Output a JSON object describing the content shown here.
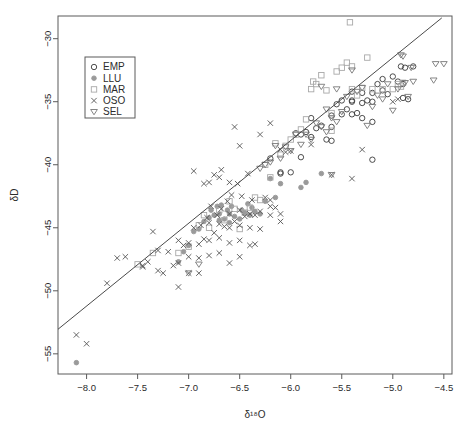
{
  "chart_data": {
    "type": "scatter",
    "title": "",
    "subtitle": "",
    "xlabel": "δ¹⁸O",
    "ylabel": "δD",
    "xlim": [
      -8.28,
      -4.42
    ],
    "ylim": [
      -56.6,
      -28.2
    ],
    "xticks": [
      -8.0,
      -7.5,
      -7.0,
      -6.5,
      -6.0,
      -5.5,
      -5.0,
      -4.5
    ],
    "xticklabels": [
      "-8.0",
      "-7.5",
      "-7.0",
      "-6.5",
      "-6.0",
      "-5.5",
      "-5.0",
      "-4.5"
    ],
    "yticks": [
      -30,
      -35,
      -40,
      -45,
      -50,
      -55
    ],
    "yticklabels": [
      "-30",
      "-35",
      "-40",
      "-45",
      "-50",
      "-55"
    ],
    "grid": false,
    "box": true,
    "legend": {
      "position": "top-left",
      "entries": [
        {
          "name": "EMP",
          "marker": "circle-open",
          "color": "#3a3a3a"
        },
        {
          "name": "LLU",
          "marker": "circle-filled",
          "color": "#9a9a9a"
        },
        {
          "name": "MAR",
          "marker": "square-open",
          "color": "#a8a8a8"
        },
        {
          "name": "OSO",
          "marker": "cross-x",
          "color": "#555555"
        },
        {
          "name": "SEL",
          "marker": "triangle-down-open",
          "color": "#777777"
        }
      ]
    },
    "fit_line": {
      "label": "regression line",
      "p1": [
        -8.28,
        -53.05
      ],
      "p2": [
        -4.52,
        -28.35
      ],
      "slope": 6.57,
      "intercept": 1.34,
      "color": "#4a4a4a",
      "width": 1.0
    },
    "series": [
      {
        "name": "EMP",
        "marker": "circle-open",
        "color": "#3a3a3a",
        "points": [
          [
            -6.2,
            -39.5
          ],
          [
            -6.1,
            -40.6
          ],
          [
            -6.1,
            -40.7
          ],
          [
            -6.0,
            -40.6
          ],
          [
            -5.95,
            -37.5
          ],
          [
            -5.9,
            -37.6
          ],
          [
            -5.9,
            -39.4
          ],
          [
            -5.85,
            -37.4
          ],
          [
            -5.8,
            -37.8
          ],
          [
            -5.8,
            -36.3
          ],
          [
            -5.75,
            -37.1
          ],
          [
            -5.7,
            -36.9
          ],
          [
            -5.65,
            -38.0
          ],
          [
            -5.6,
            -38.1
          ],
          [
            -5.6,
            -37.0
          ],
          [
            -5.6,
            -36.1
          ],
          [
            -5.55,
            -35.2
          ],
          [
            -5.5,
            -36.0
          ],
          [
            -5.5,
            -34.9
          ],
          [
            -5.45,
            -35.6
          ],
          [
            -5.4,
            -36.0
          ],
          [
            -5.4,
            -35.0
          ],
          [
            -5.4,
            -34.9
          ],
          [
            -5.4,
            -34.2
          ],
          [
            -5.35,
            -35.9
          ],
          [
            -5.3,
            -36.3
          ],
          [
            -5.3,
            -35.1
          ],
          [
            -5.3,
            -34.3
          ],
          [
            -5.25,
            -34.9
          ],
          [
            -5.2,
            -39.6
          ],
          [
            -5.2,
            -36.6
          ],
          [
            -5.2,
            -35.0
          ],
          [
            -5.2,
            -34.3
          ],
          [
            -5.15,
            -33.6
          ],
          [
            -5.1,
            -34.1
          ],
          [
            -5.1,
            -33.2
          ],
          [
            -5.05,
            -34.4
          ],
          [
            -5.0,
            -33.0
          ],
          [
            -4.95,
            -33.4
          ],
          [
            -4.92,
            -32.2
          ],
          [
            -4.9,
            -34.7
          ],
          [
            -4.9,
            -33.6
          ],
          [
            -4.88,
            -32.3
          ],
          [
            -4.85,
            -34.8
          ],
          [
            -4.8,
            -32.2
          ]
        ]
      },
      {
        "name": "LLU",
        "marker": "circle-filled",
        "color": "#9a9a9a",
        "points": [
          [
            -8.1,
            -55.7
          ],
          [
            -7.1,
            -47.7
          ],
          [
            -7.05,
            -46.9
          ],
          [
            -7.0,
            -46.4
          ],
          [
            -6.95,
            -45.3
          ],
          [
            -6.9,
            -45.1
          ],
          [
            -6.85,
            -44.5
          ],
          [
            -6.8,
            -44.2
          ],
          [
            -6.78,
            -43.6
          ],
          [
            -6.75,
            -44.0
          ],
          [
            -6.72,
            -43.3
          ],
          [
            -6.7,
            -44.4
          ],
          [
            -6.7,
            -43.9
          ],
          [
            -6.68,
            -43.2
          ],
          [
            -6.65,
            -44.3
          ],
          [
            -6.62,
            -43.6
          ],
          [
            -6.6,
            -44.6
          ],
          [
            -6.6,
            -43.9
          ],
          [
            -6.58,
            -43.3
          ],
          [
            -6.55,
            -44.1
          ],
          [
            -6.5,
            -44.3
          ],
          [
            -6.48,
            -43.6
          ],
          [
            -6.45,
            -43.8
          ],
          [
            -6.42,
            -43.1
          ],
          [
            -6.4,
            -44.0
          ],
          [
            -6.38,
            -43.4
          ],
          [
            -6.35,
            -43.7
          ],
          [
            -6.3,
            -43.9
          ],
          [
            -6.25,
            -42.9
          ],
          [
            -6.2,
            -41.1
          ],
          [
            -6.15,
            -42.6
          ],
          [
            -6.1,
            -41.5
          ],
          [
            -5.9,
            -41.8
          ],
          [
            -5.85,
            -41.4
          ],
          [
            -5.7,
            -40.7
          ]
        ]
      },
      {
        "name": "MAR",
        "marker": "square-open",
        "color": "#a8a8a8",
        "points": [
          [
            -7.5,
            -47.9
          ],
          [
            -7.35,
            -47.0
          ],
          [
            -7.1,
            -47.0
          ],
          [
            -7.0,
            -46.5
          ],
          [
            -6.9,
            -44.8
          ],
          [
            -6.85,
            -44.0
          ],
          [
            -6.8,
            -45.0
          ],
          [
            -6.7,
            -43.6
          ],
          [
            -6.65,
            -44.4
          ],
          [
            -6.6,
            -42.9
          ],
          [
            -6.55,
            -43.5
          ],
          [
            -6.5,
            -45.1
          ],
          [
            -6.45,
            -43.8
          ],
          [
            -6.4,
            -43.4
          ],
          [
            -6.35,
            -42.6
          ],
          [
            -6.3,
            -42.8
          ],
          [
            -6.25,
            -40.0
          ],
          [
            -6.2,
            -41.0
          ],
          [
            -6.15,
            -38.3
          ],
          [
            -6.1,
            -39.2
          ],
          [
            -6.05,
            -38.5
          ],
          [
            -6.0,
            -38.0
          ],
          [
            -5.95,
            -37.6
          ],
          [
            -5.9,
            -37.2
          ],
          [
            -5.85,
            -36.4
          ],
          [
            -5.8,
            -34.0
          ],
          [
            -5.78,
            -33.4
          ],
          [
            -5.75,
            -33.6
          ],
          [
            -5.7,
            -32.9
          ],
          [
            -5.65,
            -34.1
          ],
          [
            -5.6,
            -37.3
          ],
          [
            -5.6,
            -35.9
          ],
          [
            -5.55,
            -32.6
          ],
          [
            -5.5,
            -32.3
          ],
          [
            -5.45,
            -31.9
          ],
          [
            -5.42,
            -28.7
          ],
          [
            -5.4,
            -34.0
          ],
          [
            -5.4,
            -32.2
          ],
          [
            -5.35,
            -34.5
          ],
          [
            -5.3,
            -33.9
          ],
          [
            -5.25,
            -31.5
          ],
          [
            -5.2,
            -34.0
          ],
          [
            -5.1,
            -34.0
          ],
          [
            -5.0,
            -34.0
          ],
          [
            -4.95,
            -33.6
          ],
          [
            -4.92,
            -33.8
          ],
          [
            -4.9,
            -33.5
          ]
        ]
      },
      {
        "name": "OSO",
        "marker": "cross-x",
        "color": "#555555",
        "points": [
          [
            -8.1,
            -53.5
          ],
          [
            -8.0,
            -54.2
          ],
          [
            -7.8,
            -49.4
          ],
          [
            -7.7,
            -47.4
          ],
          [
            -7.62,
            -47.3
          ],
          [
            -7.45,
            -48.0
          ],
          [
            -7.4,
            -47.7
          ],
          [
            -7.35,
            -45.3
          ],
          [
            -7.3,
            -48.4
          ],
          [
            -7.3,
            -46.8
          ],
          [
            -7.25,
            -48.6
          ],
          [
            -7.2,
            -46.9
          ],
          [
            -7.15,
            -48.0
          ],
          [
            -7.1,
            -49.7
          ],
          [
            -7.1,
            -47.8
          ],
          [
            -7.1,
            -46.0
          ],
          [
            -7.05,
            -46.4
          ],
          [
            -7.0,
            -48.6
          ],
          [
            -7.0,
            -47.3
          ],
          [
            -7.0,
            -46.2
          ],
          [
            -6.95,
            -45.0
          ],
          [
            -6.9,
            -48.6
          ],
          [
            -6.9,
            -47.4
          ],
          [
            -6.9,
            -46.3
          ],
          [
            -6.88,
            -44.8
          ],
          [
            -6.85,
            -45.9
          ],
          [
            -6.82,
            -44.2
          ],
          [
            -6.8,
            -47.2
          ],
          [
            -6.8,
            -46.0
          ],
          [
            -6.8,
            -44.6
          ],
          [
            -6.78,
            -43.3
          ],
          [
            -6.75,
            -45.4
          ],
          [
            -6.72,
            -44.0
          ],
          [
            -6.7,
            -47.0
          ],
          [
            -6.7,
            -45.8
          ],
          [
            -6.7,
            -44.7
          ],
          [
            -6.68,
            -43.5
          ],
          [
            -6.65,
            -44.9
          ],
          [
            -6.62,
            -42.9
          ],
          [
            -6.6,
            -47.8
          ],
          [
            -6.6,
            -46.2
          ],
          [
            -6.6,
            -45.0
          ],
          [
            -6.6,
            -43.9
          ],
          [
            -6.58,
            -42.4
          ],
          [
            -6.55,
            -44.5
          ],
          [
            -6.52,
            -41.5
          ],
          [
            -6.5,
            -47.3
          ],
          [
            -6.5,
            -46.0
          ],
          [
            -6.5,
            -44.8
          ],
          [
            -6.5,
            -43.6
          ],
          [
            -6.48,
            -42.5
          ],
          [
            -6.45,
            -44.1
          ],
          [
            -6.42,
            -40.7
          ],
          [
            -6.4,
            -46.4
          ],
          [
            -6.4,
            -45.0
          ],
          [
            -6.4,
            -43.9
          ],
          [
            -6.38,
            -42.8
          ],
          [
            -6.35,
            -44.0
          ],
          [
            -6.3,
            -45.1
          ],
          [
            -6.3,
            -43.7
          ],
          [
            -6.25,
            -42.6
          ],
          [
            -6.2,
            -44.0
          ],
          [
            -6.2,
            -42.8
          ],
          [
            -6.15,
            -43.4
          ],
          [
            -6.1,
            -43.9
          ],
          [
            -6.1,
            -38.8
          ],
          [
            -6.05,
            -39.0
          ],
          [
            -6.0,
            -38.9
          ],
          [
            -6.95,
            -40.5
          ],
          [
            -6.85,
            -41.5
          ],
          [
            -6.8,
            -41.4
          ],
          [
            -6.75,
            -40.8
          ],
          [
            -6.7,
            -41.0
          ],
          [
            -6.68,
            -40.4
          ],
          [
            -6.6,
            -41.4
          ],
          [
            -6.55,
            -37.0
          ],
          [
            -6.5,
            -38.5
          ],
          [
            -6.3,
            -37.6
          ],
          [
            -6.2,
            -36.7
          ],
          [
            -5.8,
            -38.4
          ],
          [
            -5.6,
            -40.8
          ],
          [
            -5.4,
            -41.1
          ],
          [
            -5.3,
            -38.8
          ],
          [
            -5.0,
            -35.0
          ],
          [
            -4.95,
            -34.8
          ],
          [
            -7.45,
            -48.1
          ],
          [
            -6.35,
            -46.3
          ],
          [
            -6.1,
            -44.5
          ],
          [
            -6.2,
            -43.3
          ]
        ]
      },
      {
        "name": "SEL",
        "marker": "triangle-down-open",
        "color": "#777777",
        "points": [
          [
            -7.0,
            -48.6
          ],
          [
            -6.9,
            -47.9
          ],
          [
            -6.3,
            -40.3
          ],
          [
            -6.25,
            -40.0
          ],
          [
            -6.2,
            -39.8
          ],
          [
            -6.15,
            -38.5
          ],
          [
            -6.1,
            -39.5
          ],
          [
            -6.05,
            -38.6
          ],
          [
            -6.0,
            -38.9
          ],
          [
            -5.95,
            -37.6
          ],
          [
            -5.9,
            -38.4
          ],
          [
            -5.85,
            -37.6
          ],
          [
            -5.8,
            -38.0
          ],
          [
            -5.75,
            -36.7
          ],
          [
            -5.7,
            -37.0
          ],
          [
            -5.65,
            -35.6
          ],
          [
            -5.6,
            -40.8
          ],
          [
            -5.6,
            -36.3
          ],
          [
            -5.55,
            -34.0
          ],
          [
            -5.5,
            -35.8
          ],
          [
            -5.45,
            -34.6
          ],
          [
            -5.4,
            -32.5
          ],
          [
            -5.35,
            -34.2
          ],
          [
            -5.3,
            -33.9
          ],
          [
            -5.25,
            -36.9
          ],
          [
            -5.2,
            -35.4
          ],
          [
            -5.15,
            -34.5
          ],
          [
            -5.1,
            -34.8
          ],
          [
            -5.05,
            -33.6
          ],
          [
            -5.0,
            -35.7
          ],
          [
            -4.95,
            -34.0
          ],
          [
            -4.92,
            -31.3
          ],
          [
            -4.9,
            -31.4
          ],
          [
            -4.88,
            -33.5
          ],
          [
            -4.85,
            -34.6
          ],
          [
            -4.82,
            -32.3
          ],
          [
            -4.8,
            -33.4
          ],
          [
            -4.6,
            -33.3
          ],
          [
            -4.58,
            -32.0
          ],
          [
            -4.5,
            -32.0
          ],
          [
            -5.7,
            -33.8
          ],
          [
            -5.65,
            -37.4
          ],
          [
            -5.55,
            -36.6
          ]
        ]
      }
    ]
  },
  "plot_geometry": {
    "box_left": 58,
    "box_right": 452,
    "box_top": 16,
    "box_bottom": 374,
    "legend_box": {
      "x": 85,
      "y": 57,
      "w": 50,
      "h": 61
    }
  }
}
